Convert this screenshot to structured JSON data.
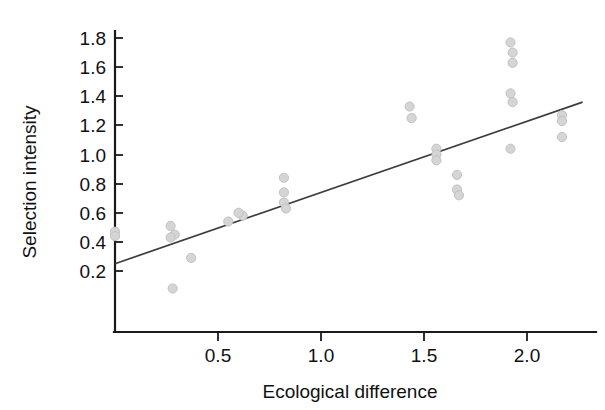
{
  "chart_data": {
    "type": "scatter",
    "title": "",
    "xlabel": "Ecological difference",
    "ylabel": "Selection intensity",
    "xlim": [
      -0.06,
      2.32
    ],
    "ylim": [
      0.0,
      1.88
    ],
    "xticks": [
      0.5,
      1.0,
      1.5,
      2.0
    ],
    "xticklabels": [
      "0.5",
      "1.0",
      "1.5",
      "2.0"
    ],
    "yticks": [
      0.2,
      0.4,
      0.6,
      0.8,
      1.0,
      1.2,
      1.4,
      1.6,
      1.8
    ],
    "yticklabels": [
      "0.2",
      "0.4",
      "0.6",
      "0.8",
      "1.0",
      "1.2",
      "1.4",
      "1.6",
      "1.8"
    ],
    "grid": false,
    "legend": "none",
    "point_color": "#d5d5d5",
    "line_color": "#3c3c3c",
    "axis_color": "#1a1a1a",
    "points": [
      {
        "x": 0.0,
        "y": 0.47
      },
      {
        "x": 0.0,
        "y": 0.44
      },
      {
        "x": 0.27,
        "y": 0.51
      },
      {
        "x": 0.29,
        "y": 0.45
      },
      {
        "x": 0.27,
        "y": 0.43
      },
      {
        "x": 0.28,
        "y": 0.08
      },
      {
        "x": 0.37,
        "y": 0.29
      },
      {
        "x": 0.55,
        "y": 0.54
      },
      {
        "x": 0.62,
        "y": 0.58
      },
      {
        "x": 0.6,
        "y": 0.6
      },
      {
        "x": 0.82,
        "y": 0.84
      },
      {
        "x": 0.82,
        "y": 0.74
      },
      {
        "x": 0.82,
        "y": 0.67
      },
      {
        "x": 0.83,
        "y": 0.63
      },
      {
        "x": 1.43,
        "y": 1.33
      },
      {
        "x": 1.44,
        "y": 1.25
      },
      {
        "x": 1.56,
        "y": 1.04
      },
      {
        "x": 1.56,
        "y": 1.0
      },
      {
        "x": 1.56,
        "y": 0.96
      },
      {
        "x": 1.66,
        "y": 0.86
      },
      {
        "x": 1.66,
        "y": 0.76
      },
      {
        "x": 1.67,
        "y": 0.72
      },
      {
        "x": 1.92,
        "y": 1.77
      },
      {
        "x": 1.93,
        "y": 1.7
      },
      {
        "x": 1.93,
        "y": 1.63
      },
      {
        "x": 1.92,
        "y": 1.42
      },
      {
        "x": 1.93,
        "y": 1.36
      },
      {
        "x": 1.92,
        "y": 1.04
      },
      {
        "x": 2.17,
        "y": 1.27
      },
      {
        "x": 2.17,
        "y": 1.23
      },
      {
        "x": 2.17,
        "y": 1.12
      }
    ],
    "trend": {
      "x0": 0.0,
      "y0": 0.25,
      "x1": 2.27,
      "y1": 1.36
    }
  }
}
